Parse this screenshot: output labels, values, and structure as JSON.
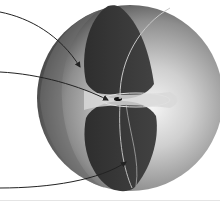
{
  "diagram": {
    "type": "3d-sphere-cutaway",
    "sphere": {
      "cx": 130,
      "cy": 98,
      "r": 93,
      "highlight_color": "#f2f2f2",
      "mid_color": "#9a9a9a",
      "edge_color": "#4a4a4a"
    },
    "lobes": {
      "color": "#383838",
      "upper": "top",
      "lower": "bottom"
    },
    "center_ring": {
      "cx": 130,
      "cy": 100,
      "rx": 38,
      "ry": 8,
      "color": "#d0d0d0"
    },
    "arrows": [
      {
        "id": "arrow-top",
        "from": [
          0,
          12
        ],
        "to": [
          80,
          68
        ]
      },
      {
        "id": "arrow-middle",
        "from": [
          0,
          72
        ],
        "to": [
          108,
          100
        ]
      },
      {
        "id": "arrow-bottom",
        "from": [
          0,
          188
        ],
        "to": [
          126,
          162
        ]
      }
    ],
    "labels": []
  }
}
